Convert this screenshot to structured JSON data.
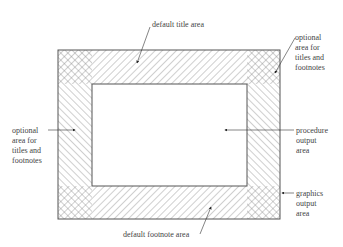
{
  "diagram": {
    "caption_partial": "",
    "regions": [
      {
        "id": "title",
        "label": "default title area",
        "hatch": "forward"
      },
      {
        "id": "footnote",
        "label": "default footnote area",
        "hatch": "forward"
      },
      {
        "id": "left",
        "label_lines": [
          "optional",
          "area for",
          "titles and",
          "footnotes"
        ],
        "hatch": "back"
      },
      {
        "id": "right",
        "label_lines": [
          "optional",
          "area for",
          "titles and",
          "footnotes"
        ],
        "hatch": "back"
      },
      {
        "id": "procedure",
        "label_lines": [
          "procedure",
          "output",
          "area"
        ]
      },
      {
        "id": "graphics",
        "label_lines": [
          "graphics",
          "output",
          "area"
        ]
      }
    ],
    "colors": {
      "line": "#555555",
      "hatch": "#888888",
      "background": "#ffffff"
    }
  },
  "labels": {
    "title_area": "default title area",
    "footnote_area": "default footnote area",
    "right_optional": [
      "optional",
      "area for",
      "titles and",
      "footnotes"
    ],
    "left_optional": [
      "optional",
      "area for",
      "titles and",
      "footnotes"
    ],
    "procedure": [
      "procedure",
      "output",
      "area"
    ],
    "graphics": [
      "graphics",
      "output",
      "area"
    ]
  }
}
